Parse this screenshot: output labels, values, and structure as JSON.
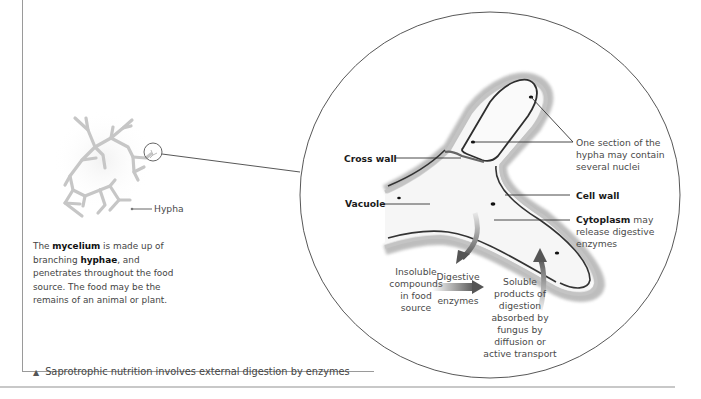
{
  "diagram": {
    "title": "Saprotrophic nutrition",
    "caption": {
      "marker": "▲",
      "text": "Saprotrophic nutrition involves external digestion by enzymes"
    },
    "mycelium": {
      "hypha_label": "Hypha",
      "description": {
        "part1": "The ",
        "term1": "mycelium",
        "part2": " is made up of branching ",
        "term2": "hyphae",
        "part3": ", and penetrates throughout the food source. The food may be the remains of an animal or plant."
      }
    },
    "magnified_view": {
      "labels": {
        "cross_wall": "Cross wall",
        "vacuole": "Vacuole",
        "cell_wall": "Cell wall",
        "cytoplasm_term": "Cytoplasm",
        "cytoplasm_rest_line1": " may",
        "cytoplasm_line2": "release digestive",
        "cytoplasm_line3": "enzymes",
        "nuclei_line1": "One section of the",
        "nuclei_line2": "hypha may contain",
        "nuclei_line3": "several nuclei"
      },
      "process": {
        "insoluble": [
          "Insoluble",
          "compounds",
          "in food",
          "source"
        ],
        "enzymes": [
          "Digestive",
          "enzymes"
        ],
        "soluble": [
          "Soluble",
          "products of",
          "digestion",
          "absorbed by",
          "fungus by",
          "diffusion or",
          "active transport"
        ]
      }
    },
    "colors": {
      "line": "#555555",
      "hypha_fill": "#f4f4f4",
      "hypha_edge": "#3a3a3a",
      "mycelium": "#c9c9c9",
      "arrow": "#777777"
    }
  }
}
